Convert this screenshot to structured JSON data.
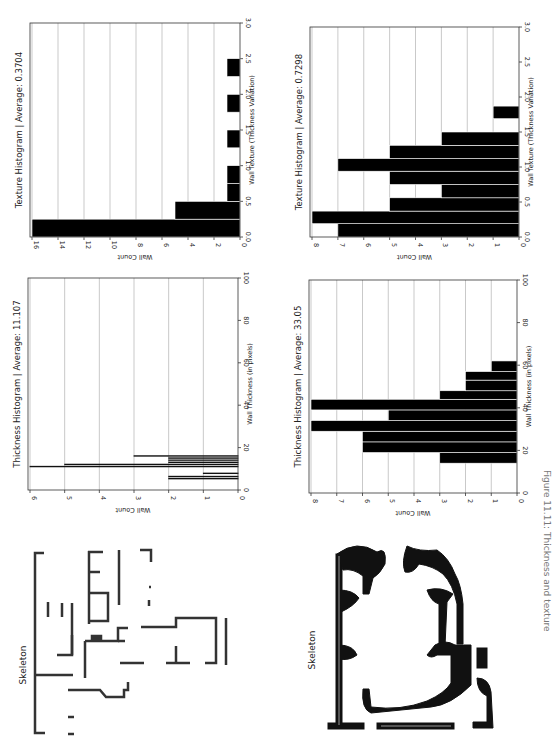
{
  "figure": {
    "caption": "Figure 11.11: Thickness and texture"
  },
  "chart_data": [
    {
      "id": "texture1",
      "type": "bar",
      "orientation": "rotated-90",
      "title": "Texture Histogram | Average: 0.3704",
      "xlabel": "Wall Texture (Thickness Variation)",
      "ylabel": "Wall Count",
      "xlim": [
        0,
        3.0
      ],
      "ylim": [
        0,
        16
      ],
      "xticks": [
        "0.0",
        "0.5",
        "1.0",
        "1.5",
        "2.0",
        "2.5",
        "3.0"
      ],
      "yticks": [
        "0",
        "2",
        "4",
        "6",
        "8",
        "10",
        "12",
        "14",
        "16"
      ],
      "grid": true,
      "bins": [
        {
          "x0": 0.0,
          "x1": 0.25,
          "count": 16
        },
        {
          "x0": 0.25,
          "x1": 0.5,
          "count": 5
        },
        {
          "x0": 0.5,
          "x1": 0.75,
          "count": 1
        },
        {
          "x0": 0.75,
          "x1": 1.0,
          "count": 1
        },
        {
          "x0": 1.25,
          "x1": 1.5,
          "count": 1
        },
        {
          "x0": 1.75,
          "x1": 2.0,
          "count": 1
        },
        {
          "x0": 2.25,
          "x1": 2.5,
          "count": 1
        }
      ]
    },
    {
      "id": "texture2",
      "type": "bar",
      "orientation": "rotated-90",
      "title": "Texture Histogram | Average: 0.7298",
      "xlabel": "Wall Texture (Thickness Variation)",
      "ylabel": "Wall Count",
      "xlim": [
        0,
        3.0
      ],
      "ylim": [
        0,
        8
      ],
      "xticks": [
        "0.0",
        "0.5",
        "1.0",
        "1.5",
        "2.0",
        "2.5",
        "3.0"
      ],
      "yticks": [
        "0",
        "1",
        "2",
        "3",
        "4",
        "5",
        "6",
        "7",
        "8"
      ],
      "grid": true,
      "bins": [
        {
          "x0": 0.0,
          "x1": 0.19,
          "count": 7
        },
        {
          "x0": 0.19,
          "x1": 0.37,
          "count": 8
        },
        {
          "x0": 0.37,
          "x1": 0.56,
          "count": 5
        },
        {
          "x0": 0.56,
          "x1": 0.75,
          "count": 3
        },
        {
          "x0": 0.75,
          "x1": 0.94,
          "count": 5
        },
        {
          "x0": 0.94,
          "x1": 1.12,
          "count": 7
        },
        {
          "x0": 1.12,
          "x1": 1.31,
          "count": 5
        },
        {
          "x0": 1.31,
          "x1": 1.5,
          "count": 3
        },
        {
          "x0": 1.69,
          "x1": 1.87,
          "count": 1
        }
      ]
    },
    {
      "id": "thickness1",
      "type": "bar",
      "orientation": "rotated-90",
      "title": "Thickness Histogram | Average: 11.107",
      "xlabel": "Wall Thickness (in pixels)",
      "ylabel": "Wall Count",
      "xlim": [
        0,
        100
      ],
      "ylim": [
        0,
        6
      ],
      "xticks": [
        "0",
        "20",
        "40",
        "60",
        "80",
        "100"
      ],
      "yticks": [
        "0",
        "1",
        "2",
        "3",
        "4",
        "5",
        "6"
      ],
      "grid": true,
      "style": "outline",
      "bins": [
        {
          "x0": 5.3,
          "x1": 5.5,
          "count": 2
        },
        {
          "x0": 6.3,
          "x1": 6.5,
          "count": 2
        },
        {
          "x0": 7.8,
          "x1": 8.0,
          "count": 1
        },
        {
          "x0": 11.0,
          "x1": 11.2,
          "count": 6
        },
        {
          "x0": 12.0,
          "x1": 12.2,
          "count": 5
        },
        {
          "x0": 13.0,
          "x1": 13.2,
          "count": 2
        },
        {
          "x0": 14.0,
          "x1": 14.2,
          "count": 2
        },
        {
          "x0": 15.0,
          "x1": 15.2,
          "count": 2
        },
        {
          "x0": 16.0,
          "x1": 16.2,
          "count": 3
        }
      ]
    },
    {
      "id": "thickness2",
      "type": "bar",
      "orientation": "rotated-90",
      "title": "Thickness Histogram | Average: 33.05",
      "xlabel": "Wall Thickness (in pixels)",
      "ylabel": "Wall Count",
      "xlim": [
        0,
        100
      ],
      "ylim": [
        0,
        8
      ],
      "xticks": [
        "0",
        "20",
        "40",
        "60",
        "80",
        "100"
      ],
      "yticks": [
        "0",
        "1",
        "2",
        "3",
        "4",
        "5",
        "6",
        "7",
        "8"
      ],
      "grid": true,
      "bins": [
        {
          "x0": 14,
          "x1": 19,
          "count": 3
        },
        {
          "x0": 19,
          "x1": 24,
          "count": 6
        },
        {
          "x0": 24,
          "x1": 29,
          "count": 6
        },
        {
          "x0": 29,
          "x1": 34,
          "count": 8
        },
        {
          "x0": 34,
          "x1": 39,
          "count": 5
        },
        {
          "x0": 39,
          "x1": 44,
          "count": 8
        },
        {
          "x0": 44,
          "x1": 48,
          "count": 3
        },
        {
          "x0": 48,
          "x1": 53,
          "count": 2
        },
        {
          "x0": 53,
          "x1": 57,
          "count": 2
        },
        {
          "x0": 57,
          "x1": 62,
          "count": 1
        }
      ]
    }
  ],
  "skeletons": [
    {
      "label": "Skeleton"
    },
    {
      "label": "Skeleton"
    }
  ]
}
